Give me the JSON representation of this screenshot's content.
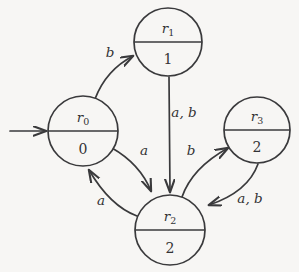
{
  "diagram": {
    "type": "state-machine",
    "background_color": "#f7f6f4",
    "stroke_color": "#3a3a3c",
    "start_arrow": {
      "name": "initial-state-arrow",
      "target": "r0"
    },
    "states": [
      {
        "id": "r0",
        "name": "r",
        "subscript": "0",
        "output": "0",
        "cx": 83,
        "cy": 131,
        "r": 35
      },
      {
        "id": "r1",
        "name": "r",
        "subscript": "1",
        "output": "1",
        "cx": 168,
        "cy": 42,
        "r": 34
      },
      {
        "id": "r2",
        "name": "r",
        "subscript": "2",
        "output": "2",
        "cx": 170,
        "cy": 230,
        "r": 35
      },
      {
        "id": "r3",
        "name": "r",
        "subscript": "3",
        "output": "2",
        "cx": 257,
        "cy": 130,
        "r": 33
      }
    ],
    "transitions": [
      {
        "id": "r0-to-r1",
        "from": "r0",
        "to": "r1",
        "label": "b",
        "label_x": 110,
        "label_y": 57
      },
      {
        "id": "r1-to-r2",
        "from": "r1",
        "to": "r2",
        "label": "a, b",
        "label_x": 184,
        "label_y": 117
      },
      {
        "id": "r0-to-r2",
        "from": "r0",
        "to": "r2",
        "label": "a",
        "label_x": 144,
        "label_y": 155
      },
      {
        "id": "r2-to-r0",
        "from": "r2",
        "to": "r0",
        "label": "a",
        "label_x": 101,
        "label_y": 205
      },
      {
        "id": "r2-to-r3",
        "from": "r2",
        "to": "r3",
        "label": "b",
        "label_x": 191,
        "label_y": 155
      },
      {
        "id": "r3-to-r2",
        "from": "r3",
        "to": "r2",
        "label": "a, b",
        "label_x": 250,
        "label_y": 203
      }
    ]
  }
}
